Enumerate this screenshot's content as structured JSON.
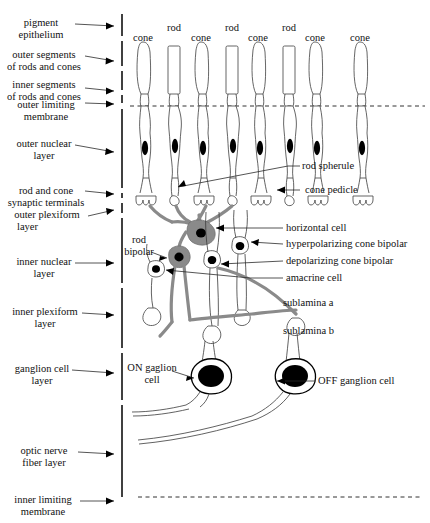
{
  "diagram": {
    "colors": {
      "ink": "#3a3a3a",
      "gray_process": "#8a8a8a",
      "nucleus": "#000000",
      "axis": "#000000"
    }
  },
  "left_labels": [
    {
      "id": "pigment-epithelium",
      "lines": [
        "pigment",
        "epithelium"
      ]
    },
    {
      "id": "outer-segments",
      "lines": [
        "outer segments",
        "of rods and cones"
      ]
    },
    {
      "id": "inner-segments",
      "lines": [
        "inner segments",
        "of rods and cones"
      ]
    },
    {
      "id": "outer-limiting-membrane",
      "lines": [
        "outer limiting",
        "membrane"
      ]
    },
    {
      "id": "outer-nuclear-layer",
      "lines": [
        "outer nuclear",
        "layer"
      ]
    },
    {
      "id": "synaptic-terminals",
      "lines": [
        "rod and cone",
        "synaptic terminals"
      ]
    },
    {
      "id": "outer-plexiform-layer",
      "lines": [
        "outer plexiform",
        "layer"
      ]
    },
    {
      "id": "inner-nuclear-layer",
      "lines": [
        "inner nuclear",
        "layer"
      ]
    },
    {
      "id": "inner-plexiform-layer",
      "lines": [
        "inner plexiform",
        "layer"
      ]
    },
    {
      "id": "ganglion-cell-layer",
      "lines": [
        "ganglion cell",
        "layer"
      ]
    },
    {
      "id": "optic-nerve-fiber-layer",
      "lines": [
        "optic nerve",
        "fiber layer"
      ]
    },
    {
      "id": "inner-limiting-membrane",
      "lines": [
        "inner limiting",
        "membrane"
      ]
    }
  ],
  "right_labels": [
    {
      "id": "rod-spherule",
      "text": "rod spherule"
    },
    {
      "id": "cone-pedicle",
      "text": "cone pedicle"
    },
    {
      "id": "horizontal-cell",
      "text": "horizontal cell"
    },
    {
      "id": "hyperpolarizing-cone-bipolar",
      "text": "hyperpolarizing cone bipolar"
    },
    {
      "id": "depolarizing-cone-bipolar",
      "text": "depolarizing cone bipolar"
    },
    {
      "id": "amacrine-cell",
      "text": "amacrine cell"
    },
    {
      "id": "sublamina-a",
      "text": "sublamina a"
    },
    {
      "id": "sublamina-b",
      "text": "sublamina b"
    },
    {
      "id": "off-ganglion-cell",
      "text": "OFF ganglion cell"
    }
  ],
  "inner_labels": [
    {
      "id": "rod-bipolar",
      "lines": [
        "rod",
        "bipolar"
      ]
    },
    {
      "id": "on-ganglion-cell",
      "lines": [
        "ON gaglion",
        "cell"
      ]
    }
  ],
  "photoreceptors": [
    {
      "type": "cone",
      "label": "cone",
      "x": 143
    },
    {
      "type": "rod",
      "label": "rod",
      "x": 174
    },
    {
      "type": "cone",
      "label": "cone",
      "x": 201
    },
    {
      "type": "rod",
      "label": "rod",
      "x": 232
    },
    {
      "type": "cone",
      "label": "cone",
      "x": 258
    },
    {
      "type": "rod",
      "label": "rod",
      "x": 289
    },
    {
      "type": "cone",
      "label": "cone",
      "x": 315
    },
    {
      "type": "cone",
      "label": "cone",
      "x": 360
    }
  ]
}
